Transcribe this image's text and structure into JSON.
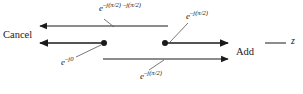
{
  "diagram": {
    "axis_variable": "z",
    "colors": {
      "stroke": "#1a1a1a",
      "background": "#ffffff",
      "text": "#1a1a1a"
    },
    "annotations": {
      "cancel": "Cancel",
      "add": "Add"
    },
    "expressions": {
      "top": {
        "base": "e",
        "exponent": "–j(π/2)",
        "trailing": "–j(π/2)"
      },
      "upper_right": {
        "base": "e",
        "exponent": "–j(π/2)"
      },
      "lower_left": {
        "base": "e",
        "exponent": "–j0"
      },
      "bottom_center": {
        "base": "e",
        "exponent": "–j(π/2)"
      }
    },
    "vectors": [
      {
        "name": "top-left-arrow",
        "from_x": 168,
        "to_x": 35,
        "y": 26,
        "direction": "left",
        "has_dot": false
      },
      {
        "name": "middle-left-arrow",
        "from_x": 104,
        "to_x": 35,
        "y": 43,
        "direction": "left",
        "has_dot": true
      },
      {
        "name": "middle-right-arrow",
        "from_x": 165,
        "to_x": 233,
        "y": 43,
        "direction": "right",
        "has_dot": true
      },
      {
        "name": "bottom-right-arrow",
        "from_x": 103,
        "to_x": 233,
        "y": 59,
        "direction": "right",
        "has_dot": false
      }
    ],
    "axis_stub": {
      "from_x": 265,
      "to_x": 286,
      "y": 43
    },
    "leader_lines": [
      {
        "name": "leader-top",
        "x1": 99,
        "y1": 18,
        "x2": 112,
        "y2": 26
      },
      {
        "name": "leader-upper-right",
        "x1": 169,
        "y1": 43,
        "x2": 188,
        "y2": 22
      },
      {
        "name": "leader-lower-left",
        "x1": 75,
        "y1": 58,
        "x2": 100,
        "y2": 45
      },
      {
        "name": "leader-bottom-center",
        "x1": 148,
        "y1": 71,
        "x2": 163,
        "y2": 60
      }
    ]
  }
}
